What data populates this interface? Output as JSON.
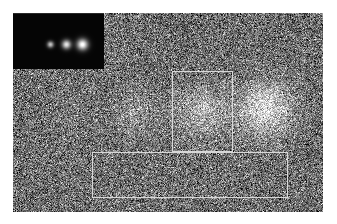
{
  "figure": {
    "panel": {
      "name": "main-noise-panel",
      "x": 13,
      "y": 13,
      "width": 310,
      "height": 199,
      "background_gray_level": 110,
      "noise_type": "gaussian-salt-pepper",
      "noise_sigma": 46
    },
    "inset": {
      "name": "ground-truth-inset",
      "x": 13,
      "y": 13,
      "width": 91,
      "height": 55,
      "background_color": "#050505",
      "label": "",
      "sources": [
        {
          "id": "inset-source-1",
          "cx": 37,
          "cy": 30,
          "radius": 3.2,
          "peak": 190
        },
        {
          "id": "inset-source-2",
          "cx": 53,
          "cy": 30,
          "radius": 4.4,
          "peak": 225
        },
        {
          "id": "inset-source-3",
          "cx": 69,
          "cy": 30,
          "radius": 5.4,
          "peak": 255
        }
      ]
    },
    "sources": [
      {
        "id": "blob-1",
        "label": "faintest",
        "cx": 57,
        "cy": 97,
        "sigma": 15,
        "amplitude": 12
      },
      {
        "id": "blob-2",
        "label": "faint",
        "cx": 122,
        "cy": 100,
        "sigma": 16,
        "amplitude": 38
      },
      {
        "id": "blob-3",
        "label": "medium",
        "cx": 188,
        "cy": 98,
        "sigma": 17,
        "amplitude": 72
      },
      {
        "id": "blob-4",
        "label": "brightest",
        "cx": 252,
        "cy": 95,
        "sigma": 18,
        "amplitude": 110
      }
    ],
    "annotations": [
      {
        "id": "roi-vertical",
        "name": "region-of-interest-box",
        "shape": "rectangle",
        "x": 172,
        "y": 71,
        "width": 61,
        "height": 81,
        "stroke_color": "#d8d8d8",
        "stroke_width": 1,
        "fill": "none"
      },
      {
        "id": "roi-horizontal",
        "name": "background-region-box",
        "shape": "rectangle",
        "x": 92,
        "y": 152,
        "width": 196,
        "height": 46,
        "stroke_color": "#d8d8d8",
        "stroke_width": 1,
        "fill": "none"
      }
    ]
  },
  "chart_data": {
    "type": "heatmap",
    "xlabel": "",
    "ylabel": "",
    "grid": false,
    "legend_position": "none",
    "colormap": "gray",
    "value_range": [
      0,
      255
    ],
    "categories": [
      "blob-1",
      "blob-2",
      "blob-3",
      "blob-4"
    ],
    "values": [
      12,
      38,
      72,
      110
    ],
    "series": [
      {
        "name": "source amplitude above background (DN)",
        "values": [
          12,
          38,
          72,
          110
        ]
      },
      {
        "name": "source sigma (px)",
        "values": [
          15,
          16,
          17,
          18
        ]
      }
    ],
    "annotations": [
      "vertical ROI box around third source",
      "horizontal background box along lower image"
    ]
  }
}
